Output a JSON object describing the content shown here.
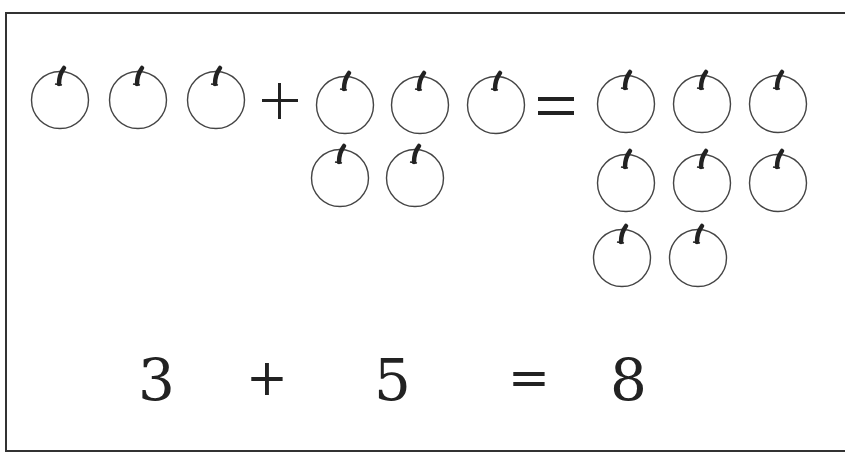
{
  "picture_equation": {
    "group_a": {
      "count": 3,
      "label": "apples"
    },
    "operator_plus": "+",
    "group_b": {
      "count": 5,
      "label": "apples"
    },
    "operator_equals": "=",
    "group_result": {
      "count": 8,
      "label": "apples"
    }
  },
  "numeric_equation": {
    "left_operand": "3",
    "plus": "+",
    "right_operand": "5",
    "equals": "=",
    "result": "8"
  },
  "icons": {
    "apple": "apple-outline-icon"
  },
  "colors": {
    "stroke": "#333333",
    "background": "#ffffff"
  }
}
